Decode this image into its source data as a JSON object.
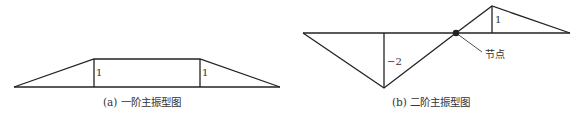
{
  "diagram_a": {
    "caption": "(a) 一阶主振型图",
    "labels": {
      "left_amplitude": "1",
      "right_amplitude": "1"
    }
  },
  "diagram_b": {
    "caption": "(b) 二阶主振型图",
    "labels": {
      "left_amplitude": "−2",
      "right_amplitude": "1",
      "node": "节点"
    }
  },
  "colors": {
    "line": "#222222",
    "text": "#333333",
    "background": "#ffffff"
  }
}
